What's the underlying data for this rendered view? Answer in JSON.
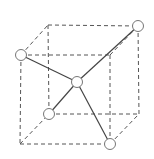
{
  "diagram": {
    "type": "tetrahedral-molecule-in-cube",
    "cube": {
      "front_face": {
        "top_left": [
          21,
          55
        ],
        "top_right": [
          110,
          55
        ],
        "bottom_right": [
          110,
          144
        ],
        "bottom_left": [
          20,
          144
        ]
      },
      "back_face": {
        "top_left": [
          48,
          25
        ],
        "top_right": [
          138,
          26
        ],
        "bottom_right": [
          139,
          114
        ],
        "bottom_left": [
          49,
          114
        ]
      },
      "edge_style": "dashed"
    },
    "atoms": [
      {
        "id": "center",
        "pos": [
          77,
          82
        ]
      },
      {
        "id": "front-top-left",
        "pos": [
          21,
          55
        ]
      },
      {
        "id": "back-top-right",
        "pos": [
          138,
          26
        ]
      },
      {
        "id": "back-bottom-left",
        "pos": [
          49,
          114
        ]
      },
      {
        "id": "front-bottom-right",
        "pos": [
          110,
          144
        ]
      }
    ],
    "bonds": [
      [
        "center",
        "front-top-left"
      ],
      [
        "center",
        "back-top-right"
      ],
      [
        "center",
        "back-bottom-left"
      ],
      [
        "center",
        "front-bottom-right"
      ]
    ],
    "colors": {
      "line": "#555555",
      "atom_fill": "#ffffff",
      "atom_stroke": "#777777"
    }
  }
}
